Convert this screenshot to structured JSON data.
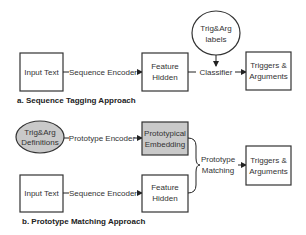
{
  "colors": {
    "stroke": "#333333",
    "gray_fill": "#c9c9c9",
    "background": "#ffffff"
  },
  "section_a": {
    "caption": "a. Sequence Tagging Approach",
    "input_box": "Input Text",
    "encoder_label": "Sequence Encoder",
    "feature_box": {
      "line1": "Feature",
      "line2": "Hidden"
    },
    "labels_ellipse": {
      "line1": "Trig&Arg",
      "line2": "labels"
    },
    "classifier_label": "Classifier",
    "output_box": {
      "line1": "Triggers &",
      "line2": "Arguments"
    }
  },
  "section_b": {
    "caption": "b. Prototype Matching Approach",
    "definitions_ellipse": {
      "line1": "Trig&Arg",
      "line2": "Definitions"
    },
    "prototype_encoder_label": "Prototype Encoder",
    "embedding_box": {
      "line1": "Prototypical",
      "line2": "Embedding"
    },
    "input_box": "Input Text",
    "encoder_label": "Sequence Encoder",
    "feature_box": {
      "line1": "Feature",
      "line2": "Hidden"
    },
    "matching_label": {
      "line1": "Prototype",
      "line2": "Matching"
    },
    "output_box": {
      "line1": "Triggers &",
      "line2": "Arguments"
    }
  }
}
